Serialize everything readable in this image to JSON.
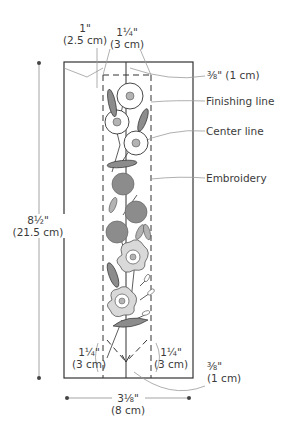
{
  "diagram": {
    "colors": {
      "line": "#333333",
      "leader": "#9a9a9a",
      "fill_dark": "#8c8c8c",
      "fill_light": "#d9d9d9",
      "fill_mid": "#b3b3b3"
    },
    "dimensions": {
      "top_left_seam": {
        "inch": "1\"",
        "cm": "(2.5 cm)"
      },
      "top_center": {
        "inch": "1¼\"",
        "cm": "(3 cm)"
      },
      "top_right_seam": {
        "inch": "⅜\"",
        "cm": "(1 cm)",
        "text": "⅜\" (1 cm)"
      },
      "height": {
        "inch": "8½\"",
        "cm": "(21.5 cm)"
      },
      "bottom_left": {
        "inch": "1¼\"",
        "cm": "(3 cm)"
      },
      "bottom_right": {
        "inch": "1¼\"",
        "cm": "(3 cm)"
      },
      "bottom_seam": {
        "inch": "⅜\"",
        "cm": "(1 cm)"
      },
      "width": {
        "inch": "3⅛\"",
        "cm": "(8 cm)"
      }
    },
    "callouts": {
      "finishing_line": "Finishing line",
      "center_line": "Center line",
      "embroidery": "Embroidery"
    }
  }
}
